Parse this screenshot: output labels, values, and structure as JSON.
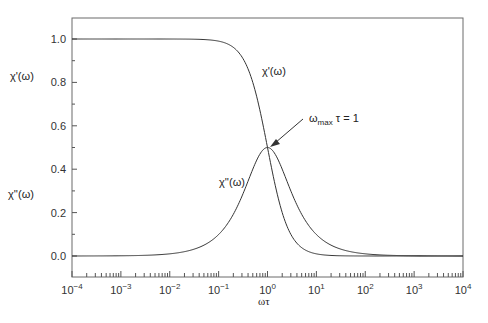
{
  "chart_data": {
    "type": "line",
    "title": "",
    "xlabel": "ωτ",
    "ylabel": "",
    "xscale": "log",
    "xlim": [
      0.0001,
      10000
    ],
    "ylim": [
      -0.1,
      1.1
    ],
    "grid": false,
    "legend": "none (inline labels)",
    "x_tick_labels": [
      "10^-4",
      "10^-3",
      "10^-2",
      "10^-1",
      "10^0",
      "10^1",
      "10^2",
      "10^3",
      "10^4"
    ],
    "y_tick_labels": [
      "0.0",
      "0.2",
      "0.4",
      "0.6",
      "0.8",
      "1.0"
    ],
    "log10_x": [
      -4,
      -3.5,
      -3,
      -2.5,
      -2,
      -1.75,
      -1.5,
      -1.25,
      -1,
      -0.75,
      -0.5,
      -0.25,
      0,
      0.25,
      0.5,
      0.75,
      1,
      1.25,
      1.5,
      1.75,
      2,
      2.5,
      3,
      3.5,
      4
    ],
    "series": [
      {
        "name": "χ'(ω)",
        "values": [
          1.0,
          1.0,
          1.0,
          1.0,
          0.9999,
          0.9997,
          0.999,
          0.9968,
          0.9901,
          0.9693,
          0.9091,
          0.7597,
          0.5,
          0.2403,
          0.0909,
          0.0307,
          0.0099,
          0.0032,
          0.001,
          0.0003,
          0.0001,
          0.0,
          0.0,
          0.0,
          0.0
        ]
      },
      {
        "name": "χ''(ω)",
        "values": [
          0.0001,
          0.0003,
          0.001,
          0.0032,
          0.01,
          0.0178,
          0.0316,
          0.0561,
          0.099,
          0.1724,
          0.2875,
          0.4272,
          0.5,
          0.4272,
          0.2875,
          0.1724,
          0.099,
          0.0561,
          0.0316,
          0.0178,
          0.01,
          0.0032,
          0.001,
          0.0003,
          0.0001
        ]
      }
    ],
    "annotations": [
      {
        "text": "χ'(ω)",
        "target": "curve label for χ'"
      },
      {
        "text": "χ''(ω)",
        "target": "curve label for χ''"
      },
      {
        "text": "ωmax τ = 1",
        "target": "peak of χ'' at ωτ = 1, arrow"
      }
    ],
    "side_labels": [
      "χ'(ω)",
      "χ''(ω)"
    ]
  },
  "labels": {
    "xlabel": "ωτ",
    "side_chi_prime": "χ'(ω)",
    "side_chi_double": "χ''(ω)",
    "curve_chi_prime": "χ'(ω)",
    "curve_chi_double": "χ''(ω)",
    "annotation_omega": "ω",
    "annotation_sub": "max",
    "annotation_rest": " τ = 1"
  },
  "colors": {
    "axis": "#555555",
    "curve": "#333333",
    "text": "#222222"
  }
}
